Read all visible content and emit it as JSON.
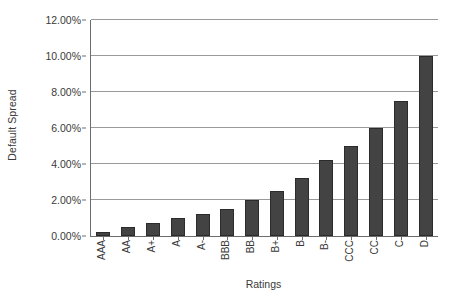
{
  "chart_data": {
    "type": "bar",
    "title": "",
    "xlabel": "Ratings",
    "ylabel": "Default Spread",
    "categories": [
      "AAA",
      "AA",
      "A+",
      "A",
      "A-",
      "BBB",
      "BB",
      "B+",
      "B",
      "B-",
      "CCC",
      "CC",
      "C",
      "D"
    ],
    "values": [
      0.002,
      0.005,
      0.0075,
      0.01,
      0.0125,
      0.015,
      0.02,
      0.025,
      0.0325,
      0.0425,
      0.05,
      0.06,
      0.075,
      0.1
    ],
    "value_labels": [
      "0.20%",
      "0.50%",
      "0.75%",
      "1.00%",
      "1.25%",
      "1.50%",
      "2.00%",
      "2.50%",
      "3.25%",
      "4.25%",
      "5.00%",
      "6.00%",
      "7.50%",
      "10.00%"
    ],
    "ylim": [
      0,
      0.12
    ],
    "ytick_values": [
      0.0,
      0.02,
      0.04,
      0.06,
      0.08,
      0.1,
      0.12
    ],
    "ytick_labels": [
      "0.00%",
      "2.00%",
      "4.00%",
      "6.00%",
      "8.00%",
      "10.00%",
      "12.00%"
    ],
    "grid": true,
    "legend": false,
    "series_name": "Default Spread",
    "bar_color": "#434343",
    "bar_edge_color": "#2b2b2b",
    "gridline_color": "#9a9a9a",
    "axis_color": "#6d6d6d",
    "background_color": "#ffffff",
    "text_color": "#3a3a3a"
  }
}
